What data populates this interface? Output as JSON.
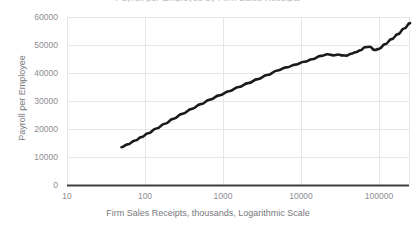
{
  "chart_data": {
    "type": "line",
    "title": "Payroll per Employee by Firm Sales Receipts",
    "xlabel": "Firm Sales Receipts, thousands, Logarithmic Scale",
    "ylabel": "Payroll per Employee",
    "xscale": "log",
    "xlim": [
      10,
      250000
    ],
    "ylim": [
      0,
      60000
    ],
    "xticks": [
      10,
      100,
      1000,
      10000,
      100000
    ],
    "xtick_labels": [
      "10",
      "100",
      "1000",
      "10000",
      "100000"
    ],
    "yticks": [
      0,
      10000,
      20000,
      30000,
      40000,
      50000,
      60000
    ],
    "ytick_labels": [
      "0",
      "10000",
      "20000",
      "30000",
      "40000",
      "50000",
      "60000"
    ],
    "grid": true,
    "legend": "none",
    "series": [
      {
        "name": "Payroll per Employee",
        "color": "#1a1a1a",
        "line_width": 2.6,
        "x": [
          50,
          60,
          75,
          90,
          110,
          140,
          180,
          230,
          300,
          400,
          520,
          680,
          900,
          1200,
          1600,
          2100,
          2800,
          3700,
          5000,
          6500,
          8500,
          11000,
          14000,
          18000,
          22000,
          26000,
          30000,
          34000,
          38000,
          44000,
          50000,
          58000,
          66000,
          76000,
          88000,
          100000,
          120000,
          145000,
          175000,
          210000,
          250000
        ],
        "y": [
          13500,
          14500,
          15900,
          17100,
          18500,
          20200,
          21900,
          23600,
          25400,
          27200,
          28900,
          30500,
          32000,
          33500,
          35000,
          36400,
          37800,
          39300,
          40900,
          42000,
          43000,
          44000,
          44900,
          46100,
          46700,
          46300,
          46600,
          46300,
          46200,
          46900,
          47400,
          48100,
          49200,
          49400,
          48200,
          48600,
          50300,
          52100,
          53900,
          55900,
          57800
        ]
      }
    ]
  },
  "axis": {
    "baseline_color": "#404040",
    "grid_color": "#e6e6ea",
    "tick_text_color": "#8d8d92",
    "title_text_color": "#77777c"
  }
}
